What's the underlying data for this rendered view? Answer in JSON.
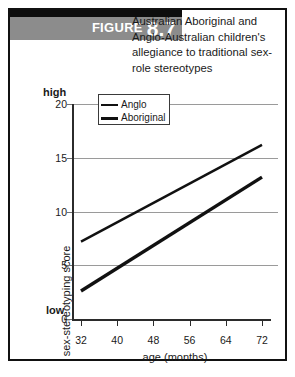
{
  "figure": {
    "label_word": "FIGURE",
    "number": "8.7",
    "title": "Australian Aboriginal and Anglo-Australian children's allegiance to traditional sex-role stereotypes"
  },
  "chart_data": {
    "type": "line",
    "title": "Australian Aboriginal and Anglo-Australian children's allegiance to traditional sex-role stereotypes",
    "xlabel": "age (months)",
    "ylabel": "sex-stereotyping score",
    "xlim": [
      32,
      72
    ],
    "ylim": [
      0,
      20
    ],
    "xticks": [
      32,
      40,
      48,
      56,
      64,
      72
    ],
    "yticks": [
      0,
      5,
      10,
      15,
      20
    ],
    "y_axis_low_label": "low",
    "y_axis_high_label": "high",
    "grid": true,
    "legend_position": "top-left",
    "series": [
      {
        "name": "Anglo",
        "style": "thin",
        "x": [
          32,
          72
        ],
        "values": [
          7.2,
          16.2
        ]
      },
      {
        "name": "Aboriginal",
        "style": "thick",
        "x": [
          32,
          72
        ],
        "values": [
          2.6,
          13.2
        ]
      }
    ]
  },
  "colors": {
    "banner_top": "#0d0d0d",
    "banner_body": "#8c8c8c",
    "line": "#111111",
    "grid": "#9a9a9a",
    "axis": "#2b2b2b",
    "border": "#111111"
  }
}
